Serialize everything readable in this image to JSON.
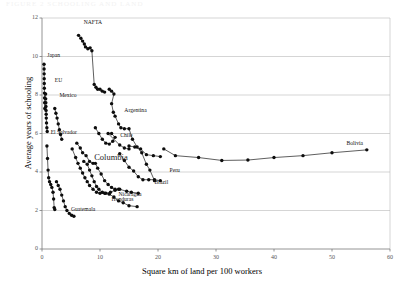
{
  "figure": {
    "faint_header": "FIGURE 2  SCHOOLING AND LAND"
  },
  "chart_data": {
    "type": "line",
    "title": "",
    "xlabel": "Square km of land per 100 workers",
    "ylabel": "Average years of schooling",
    "xlim": [
      0,
      60
    ],
    "ylim": [
      0,
      12
    ],
    "xticks": [
      0,
      10,
      20,
      30,
      40,
      50,
      60
    ],
    "yticks": [
      0,
      2,
      4,
      6,
      8,
      10,
      12
    ],
    "grid": "horizontal",
    "legend": "inline-labels",
    "marker": "filled-circle",
    "series": [
      {
        "name": "NAFTA",
        "label_x": 7.2,
        "label_y": 11.75,
        "points": [
          [
            6.3,
            11.1
          ],
          [
            6.7,
            10.95
          ],
          [
            7.0,
            10.8
          ],
          [
            7.3,
            10.65
          ],
          [
            7.5,
            10.5
          ],
          [
            7.9,
            10.4
          ],
          [
            8.3,
            10.45
          ],
          [
            8.6,
            10.3
          ],
          [
            9.0,
            8.55
          ],
          [
            9.3,
            8.4
          ],
          [
            9.6,
            8.3
          ],
          [
            10.0,
            8.3
          ],
          [
            10.4,
            8.2
          ],
          [
            10.8,
            8.15
          ]
        ]
      },
      {
        "name": "Japan",
        "label_x": 0.9,
        "label_y": 10.05,
        "points": [
          [
            0.35,
            9.6
          ],
          [
            0.36,
            9.35
          ],
          [
            0.37,
            9.1
          ],
          [
            0.38,
            8.85
          ],
          [
            0.39,
            8.6
          ],
          [
            0.4,
            8.35
          ],
          [
            0.42,
            8.1
          ],
          [
            0.44,
            7.85
          ],
          [
            0.46,
            7.6
          ],
          [
            0.48,
            7.3
          ]
        ]
      },
      {
        "name": "EU",
        "label_x": 2.2,
        "label_y": 8.75,
        "points": [
          [
            0.62,
            8.05
          ],
          [
            0.64,
            7.8
          ],
          [
            0.66,
            7.6
          ],
          [
            0.68,
            7.4
          ],
          [
            0.7,
            7.2
          ],
          [
            0.72,
            7.0
          ],
          [
            0.74,
            6.8
          ],
          [
            0.78,
            6.55
          ],
          [
            0.84,
            6.3
          ],
          [
            0.9,
            6.1
          ]
        ]
      },
      {
        "name": "Mexico",
        "label_x": 3.0,
        "label_y": 7.95,
        "points": [
          [
            2.2,
            7.3
          ],
          [
            2.4,
            7.05
          ],
          [
            2.6,
            6.8
          ],
          [
            2.8,
            6.5
          ],
          [
            3.0,
            6.2
          ],
          [
            3.2,
            5.95
          ],
          [
            3.4,
            5.7
          ]
        ]
      },
      {
        "name": "Argentina",
        "label_x": 14.2,
        "label_y": 7.15,
        "points": [
          [
            11.6,
            8.3
          ],
          [
            12.0,
            8.2
          ],
          [
            12.4,
            8.05
          ],
          [
            12.0,
            7.55
          ],
          [
            12.3,
            7.1
          ],
          [
            12.6,
            6.9
          ],
          [
            13.2,
            6.5
          ],
          [
            13.6,
            6.3
          ],
          [
            14.2,
            6.25
          ],
          [
            15.0,
            6.25
          ],
          [
            15.6,
            5.7
          ],
          [
            16.4,
            5.3
          ],
          [
            17.2,
            5.0
          ],
          [
            18.0,
            4.4
          ],
          [
            18.6,
            4.1
          ],
          [
            19.4,
            3.55
          ]
        ]
      },
      {
        "name": "Chile",
        "label_x": 13.5,
        "label_y": 5.85,
        "points": [
          [
            9.2,
            6.3
          ],
          [
            9.8,
            6.0
          ],
          [
            10.4,
            5.7
          ],
          [
            11.0,
            5.5
          ],
          [
            11.6,
            5.45
          ],
          [
            12.2,
            5.6
          ],
          [
            12.6,
            5.8
          ],
          [
            12.0,
            6.0
          ],
          [
            11.4,
            6.0
          ],
          [
            13.4,
            5.4
          ],
          [
            14.2,
            5.25
          ],
          [
            15.0,
            5.2
          ]
        ]
      },
      {
        "name": "Columbia",
        "label_x": 9.0,
        "label_y": 4.85,
        "points": [
          [
            6.0,
            5.5
          ],
          [
            6.6,
            5.25
          ],
          [
            7.0,
            5.0
          ],
          [
            7.6,
            4.85
          ],
          [
            8.2,
            4.55
          ],
          [
            8.8,
            4.45
          ],
          [
            9.2,
            4.45
          ],
          [
            9.6,
            4.2
          ],
          [
            10.2,
            3.9
          ],
          [
            10.8,
            3.55
          ],
          [
            11.4,
            3.35
          ],
          [
            12.0,
            3.2
          ],
          [
            12.6,
            3.1
          ],
          [
            13.2,
            3.1
          ]
        ]
      },
      {
        "name": "El Salvador",
        "label_x": 1.5,
        "label_y": 6.05,
        "points": [
          [
            0.85,
            5.35
          ],
          [
            0.95,
            4.7
          ],
          [
            1.05,
            4.1
          ],
          [
            1.15,
            3.7
          ],
          [
            1.3,
            3.5
          ],
          [
            1.5,
            3.35
          ],
          [
            1.7,
            3.2
          ],
          [
            1.9,
            2.95
          ],
          [
            2.0,
            2.6
          ],
          [
            2.1,
            2.15
          ],
          [
            2.2,
            2.05
          ]
        ]
      },
      {
        "name": "Guatemala",
        "label_x": 5.0,
        "label_y": 2.05,
        "points": [
          [
            2.5,
            3.5
          ],
          [
            2.8,
            3.3
          ],
          [
            3.1,
            3.1
          ],
          [
            3.4,
            2.8
          ],
          [
            3.7,
            2.5
          ],
          [
            4.0,
            2.2
          ],
          [
            4.3,
            2.0
          ],
          [
            4.7,
            1.85
          ],
          [
            5.1,
            1.75
          ],
          [
            5.5,
            1.7
          ]
        ]
      },
      {
        "name": "Honduras",
        "label_x": 12.0,
        "label_y": 2.55,
        "points": [
          [
            5.2,
            5.2
          ],
          [
            5.8,
            4.75
          ],
          [
            6.2,
            4.45
          ],
          [
            6.6,
            4.2
          ],
          [
            7.0,
            3.95
          ],
          [
            7.4,
            3.7
          ],
          [
            7.8,
            3.5
          ],
          [
            8.2,
            3.3
          ],
          [
            8.8,
            3.1
          ],
          [
            9.4,
            2.95
          ],
          [
            10.0,
            2.9
          ],
          [
            10.8,
            2.9
          ],
          [
            11.6,
            2.85
          ],
          [
            12.4,
            2.7
          ],
          [
            13.2,
            2.5
          ],
          [
            14.0,
            2.4
          ],
          [
            15.0,
            2.25
          ],
          [
            16.4,
            2.2
          ]
        ]
      },
      {
        "name": "Nicaragua",
        "label_x": 13.2,
        "label_y": 2.8,
        "points": [
          [
            7.2,
            4.55
          ],
          [
            7.8,
            4.4
          ],
          [
            8.2,
            4.1
          ],
          [
            8.6,
            3.8
          ],
          [
            9.0,
            3.5
          ],
          [
            9.4,
            3.25
          ],
          [
            9.8,
            3.1
          ],
          [
            10.4,
            2.95
          ],
          [
            11.0,
            2.9
          ],
          [
            11.8,
            2.95
          ],
          [
            12.6,
            3.05
          ],
          [
            13.4,
            3.1
          ],
          [
            14.6,
            3.0
          ],
          [
            15.4,
            2.95
          ],
          [
            16.6,
            2.9
          ]
        ]
      },
      {
        "name": "Brazil",
        "label_x": 19.4,
        "label_y": 3.45,
        "points": [
          [
            13.4,
            4.95
          ],
          [
            14.2,
            4.6
          ],
          [
            15.0,
            4.25
          ],
          [
            15.8,
            4.05
          ],
          [
            16.6,
            3.75
          ],
          [
            17.4,
            3.6
          ],
          [
            18.4,
            3.6
          ],
          [
            19.4,
            3.6
          ],
          [
            20.4,
            3.55
          ]
        ]
      },
      {
        "name": "Peru",
        "label_x": 22.0,
        "label_y": 4.05,
        "points": [
          [
            15.0,
            5.35
          ],
          [
            16.0,
            5.3
          ],
          [
            17.0,
            5.2
          ],
          [
            18.0,
            4.9
          ],
          [
            19.2,
            4.85
          ],
          [
            20.4,
            4.8
          ]
        ]
      },
      {
        "name": "Bolivia",
        "label_x": 52.5,
        "label_y": 5.45,
        "points": [
          [
            21.0,
            5.2
          ],
          [
            23.0,
            4.85
          ],
          [
            27.0,
            4.75
          ],
          [
            31.0,
            4.6
          ],
          [
            35.5,
            4.62
          ],
          [
            40.0,
            4.75
          ],
          [
            45.0,
            4.85
          ],
          [
            50.0,
            5.0
          ],
          [
            56.0,
            5.15
          ]
        ]
      }
    ]
  }
}
